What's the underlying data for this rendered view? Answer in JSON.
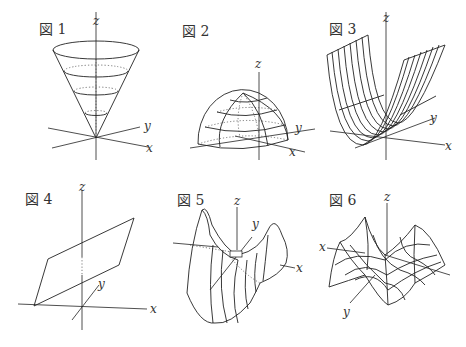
{
  "figures": [
    {
      "label": "図 1",
      "shape": "cone",
      "axes": {
        "x": "x",
        "y": "y",
        "z": "z"
      }
    },
    {
      "label": "図 2",
      "shape": "hemisphere",
      "axes": {
        "x": "x",
        "y": "y",
        "z": "z"
      }
    },
    {
      "label": "図 3",
      "shape": "parabolic-cylinder",
      "axes": {
        "x": "x",
        "y": "y",
        "z": "z"
      }
    },
    {
      "label": "図 4",
      "shape": "plane",
      "axes": {
        "x": "x",
        "y": "y",
        "z": "z"
      }
    },
    {
      "label": "図 5",
      "shape": "saddle",
      "axes": {
        "x": "x",
        "y": "y",
        "z": "z"
      }
    },
    {
      "label": "図 6",
      "shape": "wave-surface",
      "axes": {
        "x": "x",
        "y": "y",
        "z": "z"
      }
    }
  ]
}
